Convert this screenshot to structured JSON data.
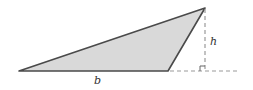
{
  "figure": {
    "type": "obtuse-triangle-area",
    "labels": {
      "base": "b",
      "height": "h"
    },
    "colors": {
      "fill": "#d9d9d9",
      "stroke": "#4a4a4a",
      "dashed": "#9a9a9a"
    },
    "vertices": [
      [
        19,
        71
      ],
      [
        168,
        71
      ],
      [
        205,
        8
      ]
    ],
    "height_foot": [
      205,
      71
    ],
    "extension_end": [
      237,
      71
    ]
  }
}
